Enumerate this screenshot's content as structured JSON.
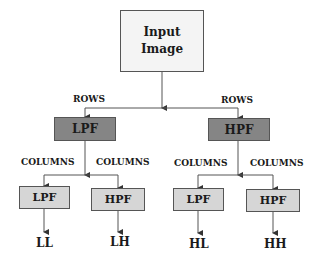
{
  "colors": {
    "input_fill": "#f4f4f4",
    "level1_fill": "#858585",
    "level2_fill": "#d6d6d6",
    "stroke": "#555555"
  },
  "input": {
    "line1": "Input",
    "line2": "Image"
  },
  "rows_labels": {
    "left": "ROWS",
    "right": "ROWS"
  },
  "level1": {
    "left": "LPF",
    "right": "HPF"
  },
  "columns_labels": {
    "ll": "COLUMNS",
    "lr": "COLUMNS",
    "rl": "COLUMNS",
    "rr": "COLUMNS"
  },
  "level2": {
    "ll": "LPF",
    "lh": "HPF",
    "hl": "LPF",
    "hh": "HPF"
  },
  "outputs": {
    "ll": "LL",
    "lh": "LH",
    "hl": "HL",
    "hh": "HH"
  }
}
